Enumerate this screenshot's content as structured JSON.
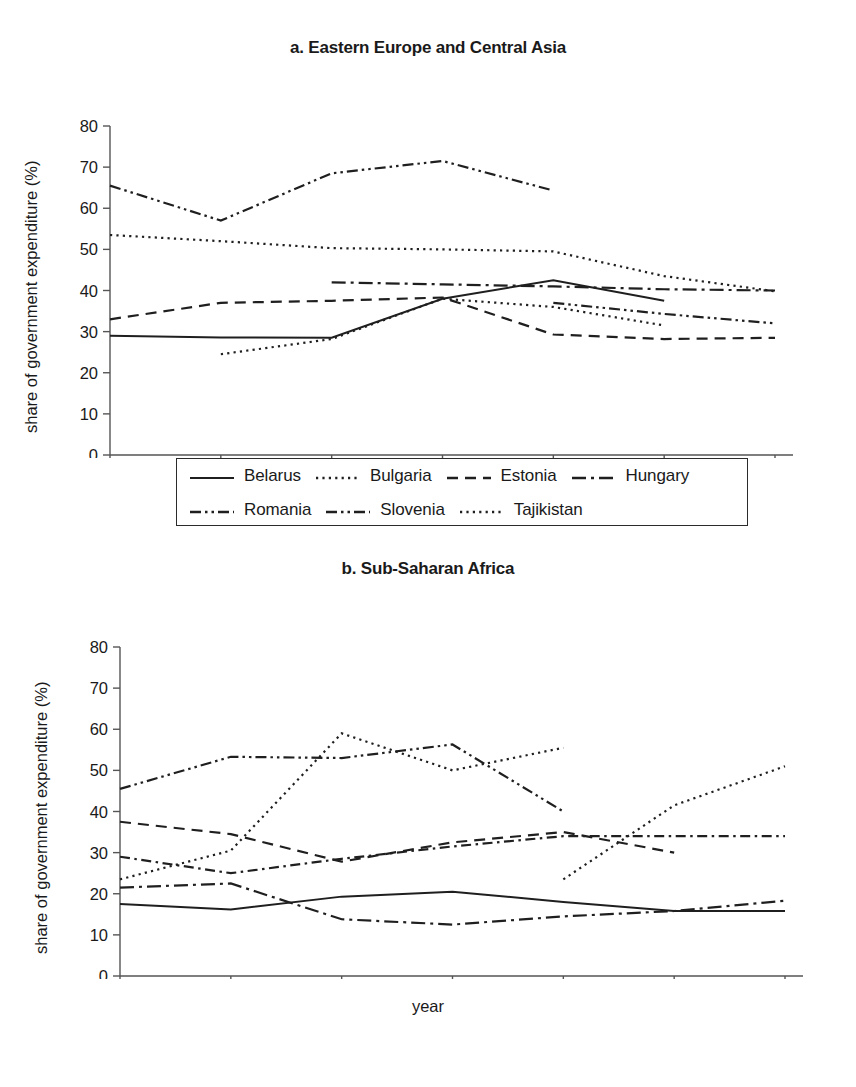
{
  "page": {
    "y_axis_label": "share of government expenditure (%)",
    "x_axis_label": "year"
  },
  "panels": [
    {
      "id": "a",
      "title": "a. Eastern Europe and Central Asia",
      "legend_rows": [
        [
          "Belarus",
          "Bulgaria",
          "Estonia",
          "Hungary"
        ],
        [
          "Romania",
          "Slovenia",
          "Tajikistan"
        ]
      ]
    },
    {
      "id": "b",
      "title": "b. Sub-Saharan Africa",
      "legend_rows": [
        [
          "Burkina Faso",
          "Cameroon",
          "Cape Verde",
          "Chad"
        ],
        [
          "Comoros",
          "Côte d'Ivoire",
          "Zimbabwe"
        ]
      ]
    }
  ],
  "chart_data": [
    {
      "type": "line",
      "title": "a. Eastern Europe and Central Asia",
      "xlabel": "year",
      "ylabel": "share of government expenditure (%)",
      "categories": [
        1998,
        1999,
        2000,
        2001,
        2002,
        2003,
        2004
      ],
      "x": [
        1998,
        1999,
        2000,
        2001,
        2002,
        2003,
        2004
      ],
      "xlim": [
        1998,
        2004
      ],
      "ylim": [
        0,
        80
      ],
      "yticks": [
        0,
        10,
        20,
        30,
        40,
        50,
        60,
        70,
        80
      ],
      "xticks": [
        1998,
        1999,
        2000,
        2001,
        2002,
        2003,
        2004
      ],
      "grid": false,
      "legend_position": "below",
      "series": [
        {
          "name": "Belarus",
          "style": "solid",
          "x": [
            1998,
            1999,
            2000,
            2001,
            2002,
            2003
          ],
          "values": [
            29.0,
            28.6,
            28.5,
            38.0,
            42.5,
            37.5
          ]
        },
        {
          "name": "Bulgaria",
          "style": "dotted",
          "x": [
            1998,
            1999,
            2000,
            2001,
            2002,
            2003,
            2004
          ],
          "values": [
            53.5,
            52.0,
            50.3,
            50.0,
            49.5,
            43.5,
            39.8
          ]
        },
        {
          "name": "Estonia",
          "style": "dashed",
          "x": [
            1998,
            1999,
            2000,
            2001,
            2002,
            2003,
            2004
          ],
          "values": [
            33.0,
            37.0,
            37.5,
            38.3,
            29.3,
            28.2,
            28.5
          ]
        },
        {
          "name": "Hungary",
          "style": "dashdot",
          "x": [
            2000,
            2001,
            2002,
            2003,
            2004
          ],
          "values": [
            42.0,
            41.5,
            41.0,
            40.3,
            40.0
          ]
        },
        {
          "name": "Romania",
          "style": "dashdotdot",
          "x": [
            1998,
            1999,
            2000,
            2001,
            2002
          ],
          "values": [
            65.5,
            57.0,
            68.5,
            71.5,
            64.3
          ]
        },
        {
          "name": "Slovenia",
          "style": "dashdotdot",
          "x": [
            2002,
            2003,
            2004
          ],
          "values": [
            37.0,
            34.3,
            32.0
          ]
        },
        {
          "name": "Tajikistan",
          "style": "dotted",
          "x": [
            1999,
            2000,
            2001,
            2002,
            2003
          ],
          "values": [
            24.5,
            28.2,
            38.0,
            36.0,
            31.5
          ]
        }
      ]
    },
    {
      "type": "line",
      "title": "b. Sub-Saharan Africa",
      "xlabel": "year",
      "ylabel": "share of government expenditure (%)",
      "categories": [
        1998,
        1999,
        2000,
        2001,
        2002,
        2003,
        2004
      ],
      "x": [
        1998,
        1999,
        2000,
        2001,
        2002,
        2003,
        2004
      ],
      "xlim": [
        1998,
        2004
      ],
      "ylim": [
        0,
        80
      ],
      "yticks": [
        0,
        10,
        20,
        30,
        40,
        50,
        60,
        70,
        80
      ],
      "xticks": [
        1998,
        1999,
        2000,
        2001,
        2002,
        2003,
        2004
      ],
      "grid": false,
      "legend_position": "below",
      "series": [
        {
          "name": "Burkina Faso",
          "style": "solid",
          "x": [
            1998,
            1999,
            2000,
            2001,
            2002,
            2003,
            2004
          ],
          "values": [
            17.5,
            16.2,
            19.3,
            20.5,
            18.0,
            15.8,
            15.8
          ]
        },
        {
          "name": "Cameroon",
          "style": "dotted",
          "x": [
            2002,
            2003,
            2004
          ],
          "values": [
            23.5,
            41.5,
            51.0
          ]
        },
        {
          "name": "Cape Verde",
          "style": "dashed",
          "x": [
            1998,
            1999,
            2000,
            2001,
            2002,
            2003
          ],
          "values": [
            37.5,
            34.5,
            27.8,
            32.5,
            35.0,
            30.0
          ]
        },
        {
          "name": "Chad",
          "style": "dashdot",
          "x": [
            1998,
            1999,
            2000,
            2001,
            2002,
            2003,
            2004
          ],
          "values": [
            21.5,
            22.5,
            13.8,
            12.5,
            14.5,
            15.8,
            18.3
          ]
        },
        {
          "name": "Comoros",
          "style": "dashdotdot",
          "x": [
            1998,
            1999,
            2000,
            2001,
            2002
          ],
          "values": [
            45.5,
            53.3,
            53.0,
            56.3,
            40.0
          ]
        },
        {
          "name": "Côte d'Ivoire",
          "style": "dashdot2",
          "x": [
            1998,
            1999,
            2000,
            2001,
            2002,
            2003,
            2004
          ],
          "values": [
            29.0,
            25.0,
            28.5,
            31.5,
            34.0,
            34.0,
            34.0
          ]
        },
        {
          "name": "Zimbabwe",
          "style": "dotted",
          "x": [
            1998,
            1999,
            2000,
            2001,
            2002
          ],
          "values": [
            23.5,
            30.5,
            59.0,
            50.0,
            55.5
          ]
        }
      ]
    }
  ]
}
